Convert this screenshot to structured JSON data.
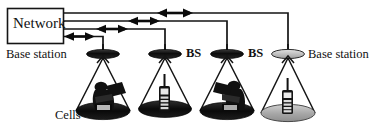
{
  "figure": {
    "type": "network-topology-diagram",
    "background_color": "#ffffff",
    "line_color": "#1a1a1a"
  },
  "network_node": {
    "label": "Network",
    "shape": "rectangle",
    "x": 7,
    "y": 8,
    "width": 56,
    "height": 35
  },
  "links": [
    {
      "id": "link-1",
      "y": 13,
      "to_station": "station-4",
      "arrow": "double",
      "arrow_x": 175
    },
    {
      "id": "link-2",
      "y": 21,
      "to_station": "station-3",
      "arrow": "double",
      "arrow_x": 144
    },
    {
      "id": "link-3",
      "y": 29,
      "to_station": "station-2",
      "arrow": "double",
      "arrow_x": 112
    },
    {
      "id": "link-4",
      "y": 36,
      "to_station": "station-1",
      "arrow": "double",
      "arrow_x": 79
    }
  ],
  "base_stations": [
    {
      "id": "station-1",
      "label": "Base station",
      "x": 103,
      "y": 55,
      "fill": "#2b2b2b"
    },
    {
      "id": "station-2",
      "label": "BS",
      "x": 165,
      "y": 55,
      "fill": "#111111"
    },
    {
      "id": "station-3",
      "label": "BS",
      "x": 227,
      "y": 55,
      "fill": "#111111"
    },
    {
      "id": "station-4",
      "label": "Base station",
      "x": 288,
      "y": 55,
      "fill": "#b8b8b8"
    }
  ],
  "cells": [
    {
      "id": "cell-1",
      "cx": 103,
      "cy": 112,
      "rx": 28,
      "ry": 9,
      "fill": "#1a1a1a",
      "device": "person-with-laptop"
    },
    {
      "id": "cell-2",
      "cx": 165,
      "cy": 110,
      "rx": 28,
      "ry": 9,
      "fill": "#1a1a1a",
      "device": "mobile-handset"
    },
    {
      "id": "cell-3",
      "cx": 227,
      "cy": 112,
      "rx": 28,
      "ry": 9,
      "fill": "#1a1a1a",
      "device": "person-with-laptop"
    },
    {
      "id": "cell-4",
      "cx": 288,
      "cy": 114,
      "rx": 28,
      "ry": 9,
      "fill": "#a8a8a8",
      "device": "mobile-handset"
    }
  ],
  "labels": {
    "network": "Network",
    "base_station_left": "Base station",
    "bs_1": "BS",
    "bs_2": "BS",
    "base_station_right": "Base station",
    "cells": "Cells"
  }
}
